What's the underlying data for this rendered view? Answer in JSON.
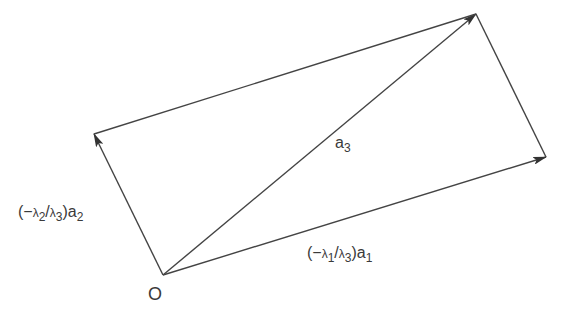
{
  "diagram": {
    "type": "vector-parallelogram",
    "points": {
      "O": [
        163,
        275
      ],
      "A2": [
        94,
        134
      ],
      "A3": [
        476,
        14
      ],
      "A1": [
        546,
        157
      ]
    },
    "labels": {
      "origin": "O",
      "a3": {
        "base": "a",
        "sub": "3"
      },
      "v2": {
        "prefix": "(−",
        "lam_a": "λ",
        "sub_a": "2",
        "slash": "/",
        "lam_b": "λ",
        "sub_b": "3",
        "close": ")a",
        "sub_c": "2"
      },
      "v1": {
        "prefix": "(−",
        "lam_a": "λ",
        "sub_a": "1",
        "slash": "/",
        "lam_b": "λ",
        "sub_b": "3",
        "close": ")a",
        "sub_c": "1"
      }
    },
    "colors": {
      "line": "#444444",
      "text": "#3a3a3a"
    }
  }
}
